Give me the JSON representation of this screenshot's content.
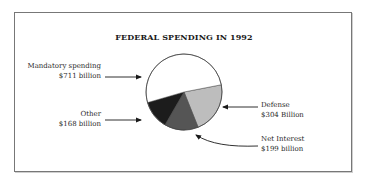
{
  "chart_data": {
    "type": "pie",
    "title": "FEDERAL SPENDING IN 1992",
    "categories": [
      "Mandatory spending",
      "Defense",
      "Net Interest",
      "Other"
    ],
    "values": [
      711,
      304,
      199,
      168
    ],
    "units": "billion dollars",
    "value_labels": [
      "$711 billion",
      "$304 Billion",
      "$199 billion",
      "$168 billion"
    ],
    "colors": [
      "#ffffff",
      "#bdbdbd",
      "#555555",
      "#1c1c1c"
    ],
    "legend": "none (callout labels with arrows)"
  },
  "labels": {
    "mandatory": {
      "name": "Mandatory spending",
      "value": "$711 billion"
    },
    "other": {
      "name": "Other",
      "value": "$168 billion"
    },
    "defense": {
      "name": "Defense",
      "value": "$304 Billion"
    },
    "interest": {
      "name": "Net Interest",
      "value": "$199 billion"
    }
  }
}
